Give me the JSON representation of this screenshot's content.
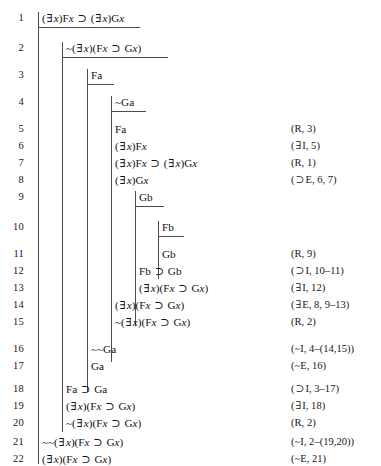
{
  "document": {
    "kind": "natural-deduction-proof",
    "line_count": 22
  },
  "lines": [
    {
      "number": "1",
      "formula": "(∃x)Fx ⊃ (∃x)Gx",
      "justification": "",
      "depth": 0
    },
    {
      "number": "2",
      "formula": "~(∃x)(Fx ⊃ Gx)",
      "justification": "",
      "depth": 1
    },
    {
      "number": "3",
      "formula": "Fa",
      "justification": "",
      "depth": 2
    },
    {
      "number": "4",
      "formula": "~Ga",
      "justification": "",
      "depth": 3
    },
    {
      "number": "5",
      "formula": "Fa",
      "justification": "(R, 3)",
      "depth": 4
    },
    {
      "number": "6",
      "formula": "(∃x)Fx",
      "justification": "(∃I, 5)",
      "depth": 4
    },
    {
      "number": "7",
      "formula": "(∃x)Fx ⊃ (∃x)Gx",
      "justification": "(R, 1)",
      "depth": 4
    },
    {
      "number": "8",
      "formula": "(∃x)Gx",
      "justification": "(⊃E, 6, 7)",
      "depth": 4
    },
    {
      "number": "9",
      "formula": "Gb",
      "justification": "",
      "depth": 5
    },
    {
      "number": "10",
      "formula": "Fb",
      "justification": "",
      "depth": 6
    },
    {
      "number": "11",
      "formula": "Gb",
      "justification": "(R, 9)",
      "depth": 6
    },
    {
      "number": "12",
      "formula": "Fb ⊃ Gb",
      "justification": "(⊃I, 10–11)",
      "depth": 5
    },
    {
      "number": "13",
      "formula": "(∃x)(Fx ⊃ Gx)",
      "justification": "(∃I, 12)",
      "depth": 5
    },
    {
      "number": "14",
      "formula": "(∃x)(Fx ⊃ Gx)",
      "justification": "(∃E, 8, 9–13)",
      "depth": 4
    },
    {
      "number": "15",
      "formula": "~(∃x)(Fx ⊃ Gx)",
      "justification": "(R, 2)",
      "depth": 4
    },
    {
      "number": "16",
      "formula": "~~Ga",
      "justification": "(~I, 4–(14,15))",
      "depth": 3
    },
    {
      "number": "17",
      "formula": "Ga",
      "justification": "(~E, 16)",
      "depth": 3
    },
    {
      "number": "18",
      "formula": "Fa ⊃ Ga",
      "justification": "(⊃I, 3–17)",
      "depth": 2
    },
    {
      "number": "19",
      "formula": "(∃x)(Fx ⊃ Gx)",
      "justification": "(∃I, 18)",
      "depth": 2
    },
    {
      "number": "20",
      "formula": "~(∃x)(Fx ⊃ Gx)",
      "justification": "(R, 2)",
      "depth": 2
    },
    {
      "number": "21",
      "formula": "~~(∃x)(Fx ⊃ Gx)",
      "justification": "(~I, 2–(19,20))",
      "depth": 1
    },
    {
      "number": "22",
      "formula": "(∃x)(Fx ⊃ Gx)",
      "justification": "(~E, 21)",
      "depth": 1
    }
  ],
  "geometry": {
    "row_tops": [
      10,
      40,
      67,
      94,
      121,
      138,
      155,
      172,
      189,
      219,
      246,
      263,
      280,
      297,
      314,
      341,
      358,
      381,
      398,
      415,
      434,
      451
    ],
    "formula_x": [
      42,
      66,
      91,
      115,
      115,
      115,
      115,
      115,
      139,
      162,
      162,
      139,
      139,
      115,
      115,
      91,
      91,
      66,
      66,
      66,
      42,
      42
    ]
  },
  "scope_bars": [
    {
      "name": "scope-bar-main",
      "x": 38,
      "top": 12,
      "height": 452
    },
    {
      "name": "scope-bar-level-1",
      "x": 62,
      "top": 42,
      "height": 390
    },
    {
      "name": "scope-bar-level-2",
      "x": 87,
      "top": 69,
      "height": 323
    },
    {
      "name": "scope-bar-level-3",
      "x": 111,
      "top": 96,
      "height": 266
    },
    {
      "name": "scope-bar-level-4",
      "x": 135,
      "top": 191,
      "height": 135
    },
    {
      "name": "scope-bar-level-5",
      "x": 158,
      "top": 221,
      "height": 58
    }
  ],
  "assumption_rules": [
    {
      "name": "assumption-rule-line-1",
      "x": 38,
      "y": 27,
      "width": 102
    },
    {
      "name": "assumption-rule-line-2",
      "x": 62,
      "y": 57,
      "width": 106
    },
    {
      "name": "assumption-rule-line-3",
      "x": 87,
      "y": 84,
      "width": 27
    },
    {
      "name": "assumption-rule-line-4",
      "x": 111,
      "y": 111,
      "width": 35
    },
    {
      "name": "assumption-rule-line-9",
      "x": 135,
      "y": 206,
      "width": 29
    },
    {
      "name": "assumption-rule-line-10",
      "x": 158,
      "y": 236,
      "width": 26
    }
  ]
}
